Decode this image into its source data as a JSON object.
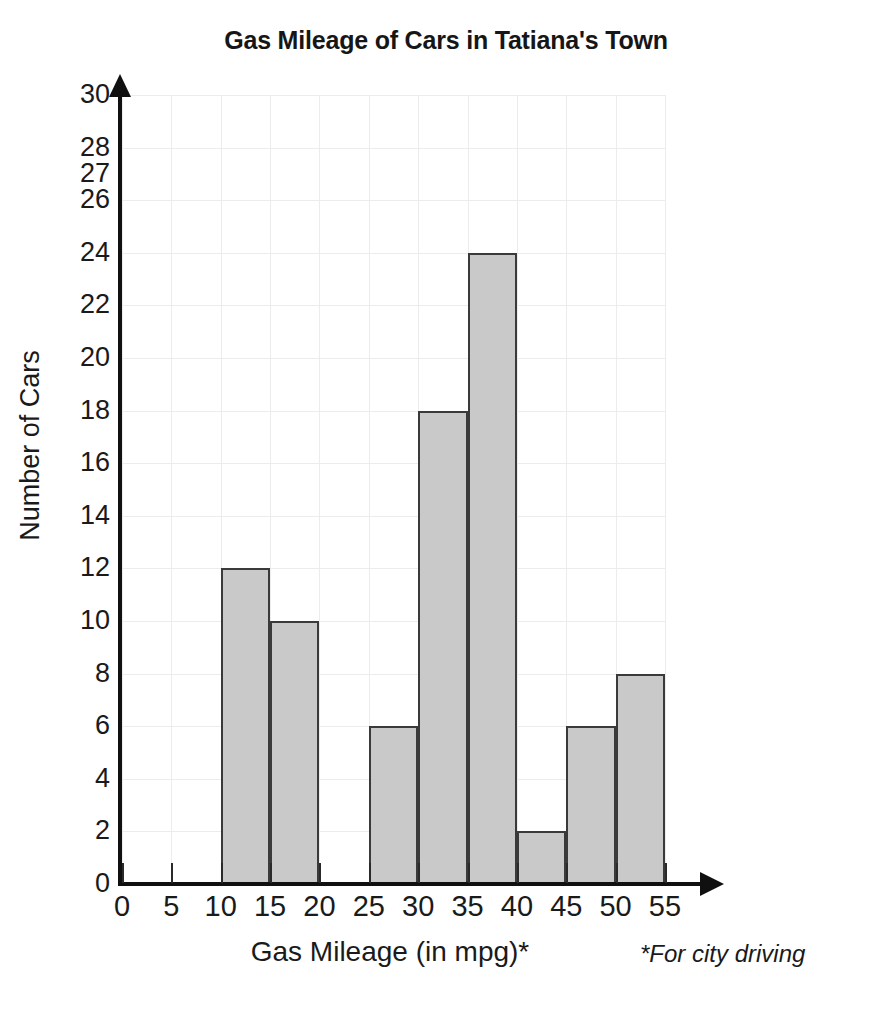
{
  "chart_data": {
    "type": "bar",
    "title": "Gas Mileage of Cars in Tatiana's Town",
    "xlabel": "Gas Mileage (in mpg)*",
    "ylabel": "Number of Cars",
    "footnote": "*For city driving",
    "categories": [
      "0-5",
      "5-10",
      "10-15",
      "15-20",
      "20-25",
      "25-30",
      "30-35",
      "35-40",
      "40-45",
      "45-50",
      "50-55"
    ],
    "bins": [
      {
        "start": 0,
        "end": 5,
        "value": 0
      },
      {
        "start": 5,
        "end": 10,
        "value": 0
      },
      {
        "start": 10,
        "end": 15,
        "value": 12
      },
      {
        "start": 15,
        "end": 20,
        "value": 10
      },
      {
        "start": 20,
        "end": 25,
        "value": 0
      },
      {
        "start": 25,
        "end": 30,
        "value": 6
      },
      {
        "start": 30,
        "end": 35,
        "value": 18
      },
      {
        "start": 35,
        "end": 40,
        "value": 24
      },
      {
        "start": 40,
        "end": 45,
        "value": 2
      },
      {
        "start": 45,
        "end": 50,
        "value": 6
      },
      {
        "start": 50,
        "end": 55,
        "value": 8
      }
    ],
    "values": [
      0,
      0,
      12,
      10,
      0,
      6,
      18,
      24,
      2,
      6,
      8
    ],
    "xticks": [
      0,
      5,
      10,
      15,
      20,
      25,
      30,
      35,
      40,
      45,
      50,
      55
    ],
    "ytick_labels": [
      "0",
      "2",
      "4",
      "6",
      "8",
      "10",
      "12",
      "14",
      "16",
      "18",
      "20",
      "22",
      "24",
      "26",
      "27",
      "28",
      "30"
    ],
    "ytick_positions": [
      0,
      2,
      4,
      6,
      8,
      10,
      12,
      14,
      16,
      18,
      20,
      22,
      24,
      26,
      27,
      28,
      30
    ],
    "xlim": [
      0,
      55
    ],
    "ylim": [
      0,
      30
    ],
    "grid": true,
    "legend": "none",
    "bar_fill_color": "#c9c9c9",
    "bar_edge_color": "#3a3a3a",
    "axis_color": "#101010",
    "grid_color": "#ececec"
  }
}
